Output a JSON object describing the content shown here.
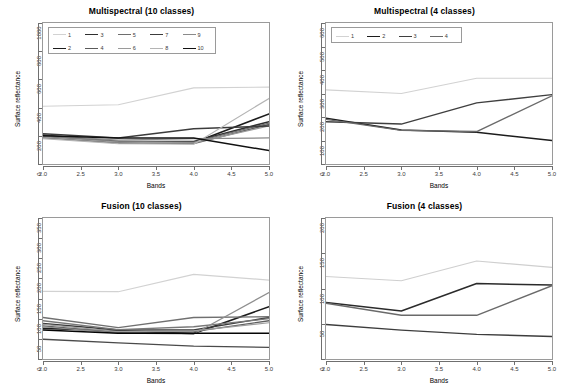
{
  "figure": {
    "axis_label_x": "Bands",
    "axis_label_y": "Surface reflectance"
  },
  "chart_data": [
    {
      "id": "multispectral-10",
      "type": "line",
      "title": "Multispectral (10 classes)",
      "xlabel": "Bands",
      "ylabel": "Surface reflectance",
      "x": [
        2,
        3,
        4,
        5
      ],
      "xticks": [
        "2.0",
        "2.5",
        "3.0",
        "3.5",
        "4.0",
        "4.5",
        "5.0"
      ],
      "xlim": [
        2,
        5
      ],
      "ylim": [
        0,
        1000
      ],
      "yticks": [
        0,
        200,
        400,
        600,
        800,
        1000
      ],
      "grid": false,
      "legend_position": "top-left",
      "legend_ncol": 5,
      "series": [
        {
          "name": "1",
          "values": [
            410,
            420,
            540,
            545
          ],
          "color": "#d2d2d2",
          "width": 1.1
        },
        {
          "name": "2",
          "values": [
            195,
            150,
            150,
            355
          ],
          "color": "#1c1c1c",
          "width": 1.6
        },
        {
          "name": "3",
          "values": [
            205,
            160,
            160,
            300
          ],
          "color": "#2f2f2f",
          "width": 1.5
        },
        {
          "name": "4",
          "values": [
            185,
            150,
            145,
            280
          ],
          "color": "#5a5a5a",
          "width": 1.4
        },
        {
          "name": "5",
          "values": [
            200,
            160,
            155,
            290
          ],
          "color": "#6e6e6e",
          "width": 1.3
        },
        {
          "name": "6",
          "values": [
            190,
            155,
            150,
            270
          ],
          "color": "#9a9a9a",
          "width": 1.2
        },
        {
          "name": "7",
          "values": [
            215,
            185,
            250,
            270
          ],
          "color": "#3c3c3c",
          "width": 1.5
        },
        {
          "name": "8",
          "values": [
            180,
            145,
            140,
            465
          ],
          "color": "#b4b4b4",
          "width": 1.2
        },
        {
          "name": "9",
          "values": [
            200,
            170,
            180,
            185
          ],
          "color": "#8a8a8a",
          "width": 1.3
        },
        {
          "name": "10",
          "values": [
            200,
            185,
            185,
            95
          ],
          "color": "#111111",
          "width": 1.5
        }
      ]
    },
    {
      "id": "multispectral-4",
      "type": "line",
      "title": "Multispectral (4 classes)",
      "xlabel": "Bands",
      "ylabel": "Surface reflectance",
      "x": [
        2,
        3,
        4,
        5
      ],
      "xticks": [
        "2.0",
        "2.5",
        "3.0",
        "3.5",
        "4.0",
        "4.5",
        "5.0"
      ],
      "xlim": [
        2,
        5
      ],
      "ylim": [
        0,
        600
      ],
      "yticks": [
        0,
        100,
        200,
        300,
        400,
        500,
        600
      ],
      "grid": false,
      "legend_position": "top-left",
      "legend_ncol": 4,
      "series": [
        {
          "name": "1",
          "values": [
            315,
            300,
            365,
            365
          ],
          "color": "#d2d2d2",
          "width": 1.2
        },
        {
          "name": "2",
          "values": [
            195,
            145,
            135,
            100
          ],
          "color": "#1c1c1c",
          "width": 1.5
        },
        {
          "name": "3",
          "values": [
            180,
            170,
            260,
            295
          ],
          "color": "#3f3f3f",
          "width": 1.4
        },
        {
          "name": "4",
          "values": [
            190,
            143,
            138,
            290
          ],
          "color": "#6a6a6a",
          "width": 1.4
        }
      ]
    },
    {
      "id": "fusion-10",
      "type": "line",
      "title": "Fusion (10 classes)",
      "xlabel": "Bands",
      "ylabel": "Surface reflectance",
      "x": [
        2,
        3,
        4,
        5
      ],
      "xticks": [
        "2.0",
        "2.5",
        "3.0",
        "3.5",
        "4.0",
        "4.5",
        "5.0"
      ],
      "xlim": [
        2,
        5
      ],
      "ylim": [
        0,
        350
      ],
      "yticks": [
        0,
        50,
        100,
        150,
        200,
        250,
        300,
        350
      ],
      "grid": false,
      "legend_position": "none",
      "series": [
        {
          "name": "1",
          "values": [
            168,
            167,
            210,
            196
          ],
          "color": "#d2d2d2",
          "width": 1.2
        },
        {
          "name": "2",
          "values": [
            76,
            70,
            63,
            130
          ],
          "color": "#1c1c1c",
          "width": 1.6
        },
        {
          "name": "3",
          "values": [
            88,
            72,
            72,
            103
          ],
          "color": "#3a3a3a",
          "width": 1.4
        },
        {
          "name": "4",
          "values": [
            82,
            66,
            68,
            95
          ],
          "color": "#5f5f5f",
          "width": 1.3
        },
        {
          "name": "5",
          "values": [
            95,
            73,
            80,
            100
          ],
          "color": "#787878",
          "width": 1.3
        },
        {
          "name": "6",
          "values": [
            86,
            68,
            70,
            90
          ],
          "color": "#9d9d9d",
          "width": 1.2
        },
        {
          "name": "7",
          "values": [
            103,
            78,
            103,
            105
          ],
          "color": "#707070",
          "width": 1.4
        },
        {
          "name": "8",
          "values": [
            80,
            64,
            62,
            165
          ],
          "color": "#8f8f8f",
          "width": 1.2
        },
        {
          "name": "9",
          "values": [
            72,
            64,
            64,
            64
          ],
          "color": "#050505",
          "width": 1.6
        },
        {
          "name": "10",
          "values": [
            49,
            40,
            32,
            29
          ],
          "color": "#4a4a4a",
          "width": 1.3
        }
      ]
    },
    {
      "id": "fusion-4",
      "type": "line",
      "title": "Fusion (4 classes)",
      "xlabel": "Bands",
      "ylabel": "Surface reflectance",
      "x": [
        2,
        3,
        4,
        5
      ],
      "xticks": [
        "2.0",
        "2.5",
        "3.0",
        "3.5",
        "4.0",
        "4.5",
        "5.0"
      ],
      "xlim": [
        2,
        5
      ],
      "ylim": [
        0,
        200
      ],
      "yticks": [
        0,
        50,
        100,
        150,
        200
      ],
      "grid": false,
      "legend_position": "none",
      "series": [
        {
          "name": "1",
          "values": [
            117,
            111,
            139,
            130
          ],
          "color": "#cfcfcf",
          "width": 1.2
        },
        {
          "name": "2",
          "values": [
            80,
            68,
            107,
            105
          ],
          "color": "#2b2b2b",
          "width": 1.5
        },
        {
          "name": "3",
          "values": [
            79,
            62,
            62,
            104
          ],
          "color": "#6a6a6a",
          "width": 1.4
        },
        {
          "name": "4",
          "values": [
            49,
            41,
            35,
            32
          ],
          "color": "#3d3d3d",
          "width": 1.4
        }
      ]
    }
  ]
}
